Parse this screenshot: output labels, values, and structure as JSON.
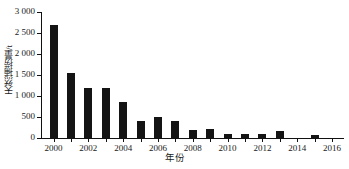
{
  "chart_data": {
    "type": "bar",
    "title": "",
    "xlabel": "年份",
    "ylabel": "天然捕捞量/t",
    "categories": [
      "2000",
      "2001",
      "2002",
      "2003",
      "2004",
      "2005",
      "2006",
      "2007",
      "2008",
      "2009",
      "2010",
      "2011",
      "2012",
      "2013",
      "2014",
      "2015",
      "2016"
    ],
    "values": [
      2700,
      1550,
      1200,
      1200,
      850,
      400,
      500,
      410,
      200,
      220,
      90,
      90,
      85,
      170,
      0,
      80,
      0
    ],
    "ylim": [
      0,
      3000
    ],
    "ytick_values": [
      0,
      500,
      1000,
      1500,
      2000,
      2500,
      3000
    ],
    "ytick_labels": [
      "0",
      "500",
      "1 000",
      "1 500",
      "2 000",
      "2 500",
      "3 000"
    ],
    "xtick_labels": [
      "2000",
      "",
      "2002",
      "",
      "2004",
      "",
      "2006",
      "",
      "2008",
      "",
      "2010",
      "",
      "2012",
      "",
      "2014",
      "",
      "2016"
    ],
    "grid": false,
    "legend": false,
    "bar_color": "#141414",
    "axis_color": "#111111"
  }
}
